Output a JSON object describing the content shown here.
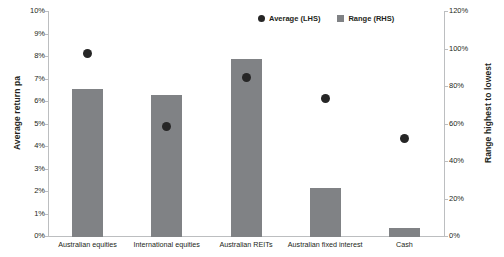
{
  "chart_data": {
    "type": "bar",
    "title": "",
    "categories": [
      "Australian equities",
      "International equities",
      "Australian REITs",
      "Australian fixed interest",
      "Cash"
    ],
    "series": [
      {
        "name": "Average (LHS)",
        "type": "scatter",
        "axis": "left",
        "values": [
          8.1,
          4.85,
          7.05,
          6.1,
          4.35
        ]
      },
      {
        "name": "Range (RHS)",
        "type": "bar",
        "axis": "right",
        "values": [
          79,
          76,
          95,
          26,
          5
        ]
      }
    ],
    "xlabel": "",
    "ylabel": "Average return pa",
    "y2label": "Range highest to lowest",
    "ylim": [
      0,
      10
    ],
    "y2lim": [
      0,
      120
    ],
    "ytick_labels": [
      "0%",
      "1%",
      "2%",
      "3%",
      "4%",
      "5%",
      "6%",
      "7%",
      "8%",
      "9%",
      "10%"
    ],
    "y2tick_labels": [
      "0%",
      "20%",
      "40%",
      "60%",
      "80%",
      "100%",
      "120%"
    ],
    "grid": false,
    "legend_position": "top-right",
    "colors": {
      "bar": "#808285",
      "dot": "#262626",
      "axis": "#bcbec0",
      "text": "#231f20"
    }
  },
  "legend": {
    "items": [
      {
        "label": "Average (LHS)",
        "marker": "circle-marker"
      },
      {
        "label": "Range (RHS)",
        "marker": "square-marker"
      }
    ]
  }
}
